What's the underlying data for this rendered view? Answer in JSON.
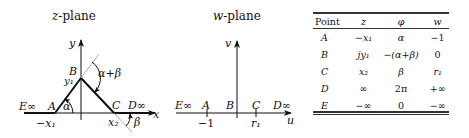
{
  "z_plane": {
    "title_var": "z",
    "title_suffix": "-plane",
    "labels": {
      "y_axis": "y",
      "x_axis": "x",
      "B": "B",
      "y1": "y₁",
      "alpha_plus_beta": "α+β",
      "E_inf": "E∞",
      "A": "A",
      "alpha": "α",
      "C": "C",
      "D_inf": "D∞",
      "neg_x1": "−x₁",
      "x2": "x₂",
      "beta": "β"
    }
  },
  "w_plane": {
    "title_var": "w",
    "title_suffix": "-plane",
    "labels": {
      "v_axis": "v",
      "u_axis": "u",
      "E_inf": "E∞",
      "A": "A",
      "B": "B",
      "C": "C",
      "D_inf": "D∞",
      "neg_one": "−1",
      "r1": "r₁"
    }
  },
  "table": {
    "headers": [
      "Point",
      "z",
      "φ",
      "w"
    ],
    "rows": [
      [
        "A",
        "−x₁",
        "α",
        "−1"
      ],
      [
        "B",
        "jy₁",
        "−(α+β)",
        "0"
      ],
      [
        "C",
        "x₂",
        "β",
        "r₁"
      ],
      [
        "D",
        "∞",
        "2π",
        "+∞"
      ],
      [
        "E",
        "−∞",
        "0",
        "−∞"
      ]
    ]
  }
}
